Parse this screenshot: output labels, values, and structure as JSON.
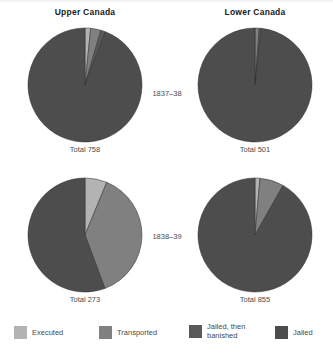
{
  "figure": {
    "column_titles": [
      "Upper Canada",
      "Lower Canada"
    ],
    "period_labels": [
      "1837–38",
      "1838–39"
    ]
  },
  "legend": {
    "items": [
      {
        "label": "Executed",
        "color": "#b3b3b3",
        "key": "executed"
      },
      {
        "label": "Transported",
        "color": "#808080",
        "key": "transported"
      },
      {
        "label": "Jailed, then\nbanished",
        "color": "#595959",
        "key": "jailed_banished"
      },
      {
        "label": "Jailed",
        "color": "#4d4d4d",
        "key": "jailed"
      }
    ]
  },
  "chart_data": {
    "type": "pie",
    "legend_position": "bottom",
    "categories": [
      "Executed",
      "Transported",
      "Jailed, then banished",
      "Jailed"
    ],
    "colors": [
      "#b3b3b3",
      "#808080",
      "#595959",
      "#4d4d4d"
    ],
    "panels": [
      {
        "region": "Upper Canada",
        "period": "1837–38",
        "total_label": "Total 758",
        "total": 758,
        "values": [
          12,
          22,
          10,
          714
        ],
        "percents": [
          1.6,
          2.9,
          1.3,
          94.2
        ]
      },
      {
        "region": "Lower Canada",
        "period": "1837–38",
        "total_label": "Total 501",
        "total": 501,
        "values": [
          0,
          6,
          3,
          492
        ],
        "percents": [
          0.0,
          1.2,
          0.6,
          98.2
        ]
      },
      {
        "region": "Upper Canada",
        "period": "1838–39",
        "total_label": "Total 273",
        "total": 273,
        "values": [
          17,
          104,
          0,
          152
        ],
        "percents": [
          6.2,
          38.1,
          0.0,
          55.7
        ]
      },
      {
        "region": "Lower Canada",
        "period": "1838–39",
        "total_label": "Total 855",
        "total": 855,
        "values": [
          12,
          58,
          0,
          785
        ],
        "percents": [
          1.4,
          6.8,
          0.0,
          91.8
        ]
      }
    ]
  }
}
